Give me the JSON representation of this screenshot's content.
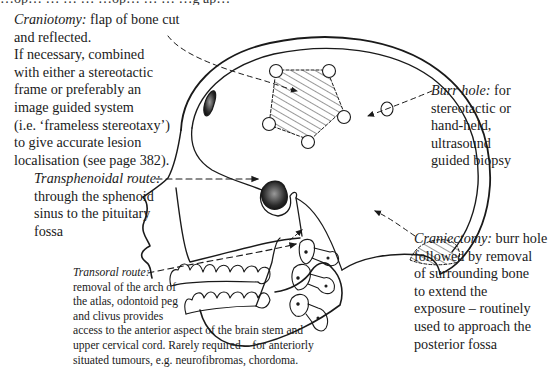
{
  "page_header_fragment": "…op… … … … …op… … … …g ap…",
  "diagram": {
    "labels": {
      "craniotomy": {
        "term": "Craniotomy:",
        "lines": [
          "flap of bone cut",
          "and reflected.",
          "If necessary, combined",
          "with either a stereotactic",
          "frame or preferably an",
          "image guided system",
          "(i.e. ‘frameless stereotaxy’)",
          "to give accurate lesion",
          "localisation (see page 382)."
        ]
      },
      "transphenoidal": {
        "term": "Transphenoidal route:",
        "lines": [
          "through the sphenoid",
          "sinus to the pituitary",
          "fossa"
        ]
      },
      "transoral": {
        "term": "Transoral route:",
        "lines": [
          "removal of the arch of",
          "the atlas, odontoid peg",
          "and clivus provides",
          "access to the anterior aspect of the brain stem and",
          "upper cervical cord. Rarely required – for anteriorly",
          "situated tumours, e.g. neurofibromas, chordoma."
        ]
      },
      "burr_hole": {
        "term": "Burr hole:",
        "lines": [
          "for",
          "stereotactic or",
          "hand-held,",
          "ultrasound",
          "guided biopsy"
        ]
      },
      "craniectomy": {
        "term": "Craniectomy:",
        "lines": [
          "burr hole",
          "followed by removal",
          "of surrounding bone",
          "to extend the",
          "exposure – routinely",
          "used to approach the",
          "posterior fossa"
        ]
      }
    },
    "colors": {
      "ink": "#1a1a1a",
      "background": "#ffffff"
    }
  }
}
